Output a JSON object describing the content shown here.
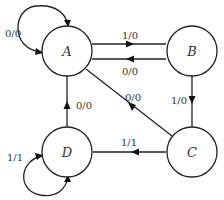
{
  "diagram": {
    "type": "state-transition-diagram",
    "states": [
      {
        "id": "A",
        "label": "A"
      },
      {
        "id": "B",
        "label": "B"
      },
      {
        "id": "C",
        "label": "C"
      },
      {
        "id": "D",
        "label": "D"
      }
    ],
    "transitions": [
      {
        "from": "A",
        "to": "A",
        "label": "0/0"
      },
      {
        "from": "A",
        "to": "B",
        "label": "1/0"
      },
      {
        "from": "B",
        "to": "A",
        "label": "0/0"
      },
      {
        "from": "B",
        "to": "C",
        "label": "1/0"
      },
      {
        "from": "C",
        "to": "A",
        "label": "0/0"
      },
      {
        "from": "C",
        "to": "D",
        "label": "1/1"
      },
      {
        "from": "D",
        "to": "A",
        "label": "0/0"
      },
      {
        "from": "D",
        "to": "D",
        "label": "1/1"
      }
    ]
  }
}
